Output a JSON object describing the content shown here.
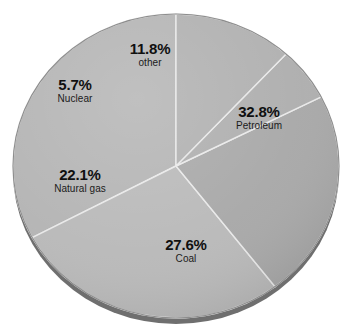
{
  "chart_data": {
    "type": "pie",
    "title": "",
    "subtitle": "",
    "xlabel": "",
    "ylabel": "",
    "legend": "none",
    "grid": false,
    "units": "percent",
    "start_angle_deg": 90,
    "direction": "counterclockwise",
    "categories": [
      "Petroleum",
      "Coal",
      "Natural gas",
      "Nuclear",
      "other"
    ],
    "values": [
      32.8,
      27.6,
      22.1,
      5.7,
      11.8
    ],
    "slices": [
      {
        "name": "Petroleum",
        "label": "Petroleum",
        "percent": 32.8,
        "percent_text": "32.8%",
        "color": "#b4b4b4"
      },
      {
        "name": "Coal",
        "label": "Coal",
        "percent": 27.6,
        "percent_text": "27.6%",
        "color": "#b9b9b9"
      },
      {
        "name": "Natural gas",
        "label": "Natural gas",
        "percent": 22.1,
        "percent_text": "22.1%",
        "color": "#a8a8a8"
      },
      {
        "name": "Nuclear",
        "label": "Nuclear",
        "percent": 5.7,
        "percent_text": "5.7%",
        "color": "#aeaeae"
      },
      {
        "name": "other",
        "label": "other",
        "percent": 11.8,
        "percent_text": "11.8%",
        "color": "#b0b0b0"
      }
    ]
  },
  "style": {
    "background": "#ffffff",
    "separator_color": "#e9e9e9",
    "rim_color": "#6e6e6e",
    "edge_color": "#8f8f8f",
    "text_color": "#101010"
  }
}
